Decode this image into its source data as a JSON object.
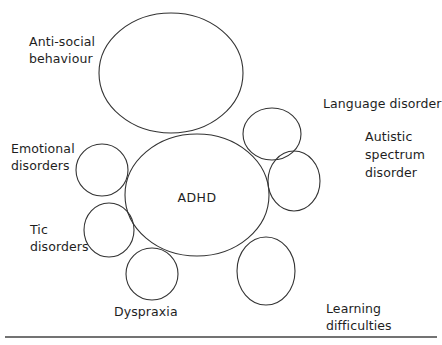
{
  "diagram": {
    "type": "overlapping-circles",
    "central": {
      "label": "ADHD",
      "cx": 197,
      "cy": 195,
      "rx": 72,
      "ry": 61
    },
    "conditions": [
      {
        "id": "anti-social-behaviour",
        "lines": [
          "Anti-social",
          "behaviour"
        ],
        "ellipse": {
          "cx": 171,
          "cy": 73,
          "rx": 72,
          "ry": 60
        },
        "label_pos": {
          "x": 29,
          "y": 33
        }
      },
      {
        "id": "language-disorder",
        "lines": [
          "Language disorder"
        ],
        "ellipse": {
          "cx": 272,
          "cy": 134,
          "rx": 29,
          "ry": 26
        },
        "label_pos": {
          "x": 323,
          "y": 95
        }
      },
      {
        "id": "autistic-spectrum-disorder",
        "lines": [
          "Autistic",
          "spectrum",
          "disorder"
        ],
        "ellipse": {
          "cx": 294,
          "cy": 181,
          "rx": 26,
          "ry": 30
        },
        "label_pos": {
          "x": 365,
          "y": 128
        }
      },
      {
        "id": "emotional-disorders",
        "lines": [
          "Emotional",
          "disorders"
        ],
        "ellipse": {
          "cx": 102,
          "cy": 170,
          "rx": 26,
          "ry": 26
        },
        "label_pos": {
          "x": 11,
          "y": 140
        }
      },
      {
        "id": "tic-disorders",
        "lines": [
          "Tic",
          "disorders"
        ],
        "ellipse": {
          "cx": 109,
          "cy": 230,
          "rx": 25,
          "ry": 27
        },
        "label_pos": {
          "x": 30,
          "y": 221
        }
      },
      {
        "id": "dyspraxia",
        "lines": [
          "Dyspraxia"
        ],
        "ellipse": {
          "cx": 152,
          "cy": 274,
          "rx": 26,
          "ry": 26
        },
        "label_pos": {
          "x": 114,
          "y": 303
        }
      },
      {
        "id": "learning-difficulties",
        "lines": [
          "Learning",
          "difficulties"
        ],
        "ellipse": {
          "cx": 266,
          "cy": 271,
          "rx": 29,
          "ry": 34
        },
        "label_pos": {
          "x": 326,
          "y": 300
        }
      }
    ],
    "colors": {
      "stroke": "#333333",
      "text": "#1e1e1e",
      "background": "#ffffff"
    }
  }
}
